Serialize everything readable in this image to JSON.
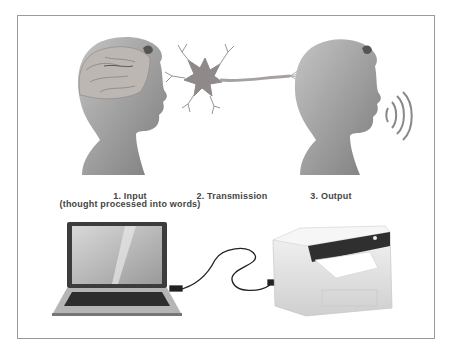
{
  "diagram": {
    "steps": [
      {
        "number": "1.",
        "title": "1. Input",
        "subtitle": "(thought processed into words)"
      },
      {
        "number": "2.",
        "title": "2. Transmission"
      },
      {
        "number": "3.",
        "title": "3. Output"
      }
    ],
    "figures": {
      "top_left": "head-with-brain",
      "top_center": "neuron",
      "top_right": "head-speaking",
      "bottom_left": "laptop",
      "bottom_center": "usb-cable",
      "bottom_right": "printer"
    },
    "colors": {
      "frame": "#9a9a9a",
      "label": "#444444",
      "skin": "#9b9b9b",
      "brain": "#b5b0ad",
      "neuron": "#8f8a89"
    }
  }
}
